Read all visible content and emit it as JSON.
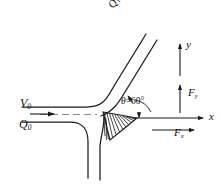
{
  "figure": {
    "type": "engineering-diagram",
    "background_color": "#ffffff",
    "line_color": "#1a1a1a"
  },
  "labels": {
    "inlet_velocity": {
      "symbol": "V",
      "subscript": "0",
      "text": "V0"
    },
    "inlet_flow": {
      "symbol": "Q",
      "subscript": "0",
      "text": "Q0"
    },
    "upper_branch_flow": {
      "symbol": "Q",
      "subscript": "1",
      "relation": "=",
      "coefficient": "0.6",
      "reference_symbol": "Q",
      "reference_subscript": "0",
      "text": "Q1 = 0.6 Q0",
      "rotation_deg": -60
    },
    "angle": {
      "symbol": "θ",
      "relation": "=",
      "value": "60",
      "unit": "°",
      "text": "θ = 60°"
    },
    "axis_x": {
      "text": "x"
    },
    "axis_y": {
      "text": "y"
    },
    "force_y": {
      "symbol": "F",
      "subscript": "y",
      "text": "Fy"
    },
    "force_x": {
      "symbol": "F",
      "subscript": "x",
      "text": "Fx"
    }
  },
  "geometry": {
    "incoming_jet": {
      "upper_wall_y": 107,
      "lower_wall_y": 122,
      "centerline_y": 114.5,
      "start_x": 22,
      "centerline_style": "dashed"
    },
    "upper_branch": {
      "angle_deg": 60,
      "flow_fraction": 0.6
    },
    "lower_branch": {
      "flow_fraction": 0.4,
      "direction": "downward"
    },
    "stagnation_wedge": {
      "hatching": true,
      "hatch_count": 14
    },
    "axes": {
      "origin_x": 148,
      "x_axis_y": 118,
      "x_axis_end": 206,
      "y_axis_x": 180,
      "y_axis_top": 41,
      "y_axis_bottom": 76
    },
    "force_arrows": {
      "fy": {
        "x": 180,
        "from_y": 113,
        "to_y": 83,
        "direction": "up"
      },
      "fx": {
        "y": 130,
        "from_x": 152,
        "to_x": 196,
        "direction": "right"
      }
    },
    "inlet_arrow": {
      "y": 114,
      "from_x": 30,
      "to_x": 56,
      "direction": "right"
    }
  }
}
